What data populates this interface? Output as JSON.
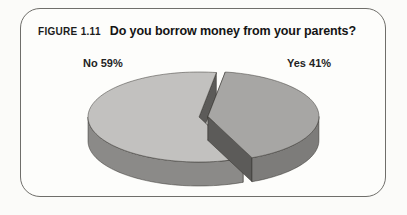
{
  "figure": {
    "label": "FIGURE 1.11",
    "title": "Do you borrow money from your parents?"
  },
  "chart_data": {
    "type": "pie",
    "style": "3d-exploded",
    "figure_label": "FIGURE 1.11",
    "title": "Do you borrow money from your parents?",
    "legend_position": "none",
    "labels_position": "above-chart",
    "slices": [
      {
        "label": "No",
        "value": 59,
        "display_label": "No 59%",
        "top_color": "#c2c1bf",
        "side_color": "#8b8a88",
        "exploded": false
      },
      {
        "label": "Yes",
        "value": 41,
        "display_label": "Yes 41%",
        "top_color": "#a7a6a4",
        "side_color": "#7d7c7a",
        "exploded": true
      }
    ]
  },
  "colors": {
    "panel_border": "#6f6e6a",
    "panel_background": "#fdfdfb",
    "page_background": "#fbfbf9",
    "cut_face": "#5c5b59",
    "edge_line": "rgba(48,46,42,0.6)",
    "text": "#1c1c1c"
  }
}
